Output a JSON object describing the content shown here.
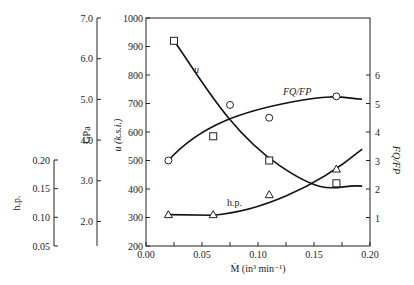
{
  "chart_data": {
    "type": "line",
    "title": "",
    "xlabel": "Ṁ (in³ min⁻¹)",
    "x_ticks": [
      "0.00",
      "0.05",
      "0.10",
      "0.15",
      "0.20"
    ],
    "xlim": [
      0.0,
      0.2
    ],
    "axes": {
      "u": {
        "label": "u (k.s.i.)",
        "ticks": [
          "200",
          "300",
          "400",
          "500",
          "600",
          "700",
          "800",
          "900",
          "1000"
        ],
        "range": [
          200,
          1000
        ]
      },
      "gpa": {
        "label": "GPa",
        "ticks": [
          "2.0",
          "3.0",
          "4.0",
          "5.0",
          "6.0",
          "7.0"
        ],
        "range": [
          1.4,
          7.0
        ]
      },
      "hp": {
        "label": "h.p.",
        "ticks": [
          "0.05",
          "0.10",
          "0.15",
          "0.20"
        ],
        "range": [
          0.05,
          0.2
        ]
      },
      "fq": {
        "label": "FQ/FP",
        "ticks": [
          "1",
          "2",
          "3",
          "4",
          "5",
          "6"
        ],
        "range": [
          0,
          8
        ]
      }
    },
    "series": [
      {
        "name": "u",
        "marker": "square",
        "axis": "u",
        "x": [
          0.025,
          0.06,
          0.11,
          0.17
        ],
        "values": [
          920,
          585,
          500,
          420
        ]
      },
      {
        "name": "FQ/FP",
        "marker": "circle",
        "axis": "fq",
        "x": [
          0.02,
          0.075,
          0.11,
          0.17
        ],
        "values": [
          3.0,
          4.95,
          4.5,
          5.25
        ]
      },
      {
        "name": "h.p.",
        "marker": "triangle",
        "axis": "u-equivalent",
        "x": [
          0.02,
          0.06,
          0.11,
          0.17
        ],
        "values": [
          310,
          310,
          380,
          470
        ]
      }
    ],
    "curve_labels": [
      "u",
      "FQ/FP",
      "h.p."
    ],
    "grid": false,
    "legend": "none"
  }
}
